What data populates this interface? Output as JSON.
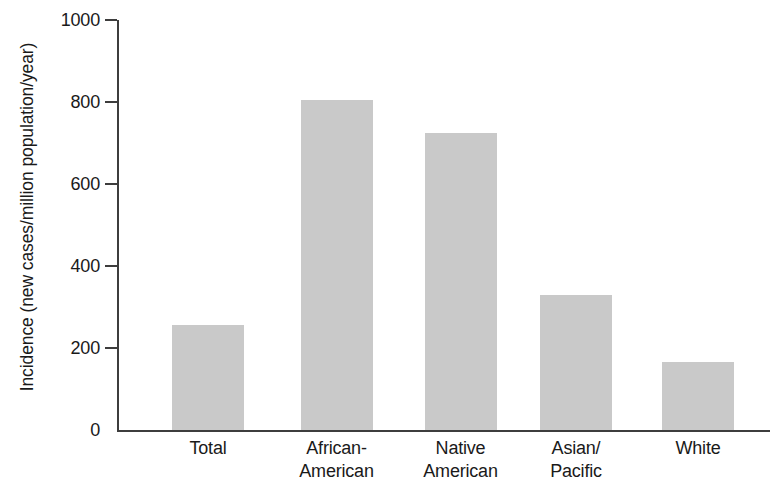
{
  "chart_data": {
    "type": "bar",
    "title": "",
    "subtitle": "",
    "xlabel": "",
    "ylabel": "Incidence (new cases/million population/year)",
    "categories": [
      "Total",
      "African-American",
      "Native American",
      "Asian/Pacific",
      "White"
    ],
    "category_lines": [
      [
        "Total"
      ],
      [
        "African-",
        "American"
      ],
      [
        "Native",
        "American"
      ],
      [
        "Asian/",
        "Pacific"
      ],
      [
        "White"
      ]
    ],
    "values": [
      255,
      805,
      725,
      330,
      165
    ],
    "ylim": [
      0,
      1000
    ],
    "yticks": [
      0,
      200,
      400,
      600,
      800,
      1000
    ],
    "ytick_labels": [
      "0",
      "200",
      "400",
      "600",
      "800",
      "1000"
    ],
    "grid": false,
    "legend": false,
    "legend_position": "none",
    "annotations": []
  },
  "style": {
    "bar_fill": "#c9c9c9",
    "axis_color": "#3d3d3d",
    "text_color": "#1a1a1a",
    "background": "#ffffff"
  }
}
